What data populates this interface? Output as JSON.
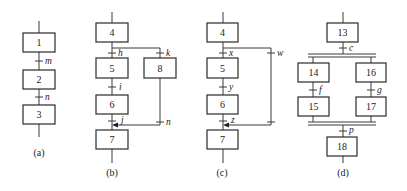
{
  "figure": {
    "panels": [
      {
        "caption": "(a)",
        "steps": [
          "1",
          "2",
          "3"
        ],
        "transitions": [
          "m",
          "n"
        ]
      },
      {
        "caption": "(b)",
        "steps": [
          "4",
          "5",
          "6",
          "7",
          "8"
        ],
        "transitions": [
          "h",
          "i",
          "j",
          "k",
          "n"
        ]
      },
      {
        "caption": "(c)",
        "steps": [
          "4",
          "5",
          "6",
          "7"
        ],
        "transitions": [
          "x",
          "y",
          "z",
          "w"
        ]
      },
      {
        "caption": "(d)",
        "steps": [
          "13",
          "14",
          "15",
          "16",
          "17",
          "18"
        ],
        "transitions": [
          "c",
          "f",
          "g",
          "p"
        ]
      }
    ]
  },
  "colors": {
    "line": "#3a3a3a",
    "box_stroke": "#2a2a2a",
    "background": "#ffffff"
  }
}
